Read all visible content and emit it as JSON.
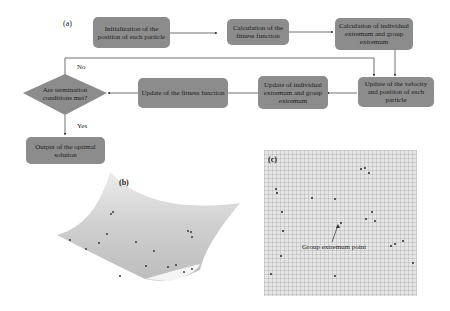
{
  "panels": {
    "a": {
      "label": "(a)",
      "boxes": {
        "init": "Initialization of the position of each particle",
        "fitness": "Calculation of the fitness function",
        "extremum_calc": "Calculation of individual extremum and group extremum",
        "velocity": "Update of the velocity and position of each particle",
        "extremum_update": "Update of individual extremum and group extremum",
        "fitness_update": "Update of the fitness function",
        "output": "Output of the optimal solution"
      },
      "decision": "Are termination conditions met?",
      "edge_labels": {
        "no": "No",
        "yes": "Yes"
      }
    },
    "b": {
      "label": "(b)",
      "description": "3D fitness surface with particles"
    },
    "c": {
      "label": "(c)",
      "annotation": "Group extremum point"
    }
  },
  "colors": {
    "box_fill": "#8c8c8c",
    "arrow": "#333333",
    "surface": "#d2d2d2",
    "grid_bg": "#e6e6e6"
  }
}
